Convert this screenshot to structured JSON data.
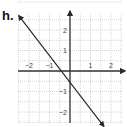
{
  "problem_label": "h.",
  "chart_data": {
    "type": "line",
    "title": "",
    "xlabel": "",
    "ylabel": "",
    "xlim": [
      -2.5,
      2.75
    ],
    "ylim": [
      -2.6,
      2.9
    ],
    "grid": true,
    "grid_step": 0.5,
    "x_ticks": [
      -2,
      -1,
      1,
      2
    ],
    "y_ticks": [
      2,
      1,
      -1,
      -2
    ],
    "x_tick_labels": [
      "−2",
      "−1",
      "1",
      "2"
    ],
    "y_tick_labels": [
      "2",
      "1",
      "−1",
      "−2"
    ],
    "series": [
      {
        "name": "line",
        "x": [
          -2.5,
          1.65
        ],
        "y": [
          2.7,
          -2.7
        ],
        "x_intercept": -0.5,
        "y_intercept": -0.5,
        "slope": -1.3,
        "arrows_both_ends": true
      }
    ]
  },
  "colors": {
    "axis": "#333333",
    "grid": "#b5b5b5",
    "line": "#2a2a2a",
    "text": "#444444"
  }
}
